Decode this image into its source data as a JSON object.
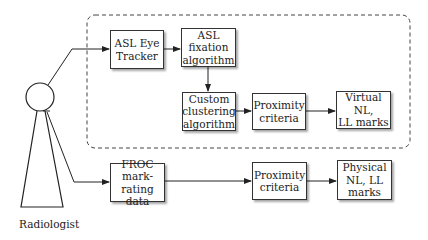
{
  "diagram": {
    "actor": {
      "label": "Radiologist"
    },
    "group": {
      "style": "dashed-rounded",
      "label": ""
    },
    "nodes": {
      "eye_tracker": "ASL Eye\nTracker",
      "fixation": "ASL\nfixation\nalgorithm",
      "clustering": "Custom\nclustering\nalgorithm",
      "proximity_top": "Proximity\ncriteria",
      "virtual_marks": "Virtual NL,\nLL marks",
      "froc": "FROC\nmark-rating\ndata",
      "proximity_bottom": "Proximity\ncriteria",
      "physical_marks": "Physical\nNL, LL\nmarks"
    },
    "edges": [
      [
        "Radiologist",
        "ASL Eye Tracker"
      ],
      [
        "ASL Eye Tracker",
        "ASL fixation algorithm"
      ],
      [
        "ASL fixation algorithm",
        "Custom clustering algorithm"
      ],
      [
        "Custom clustering algorithm",
        "Proximity criteria"
      ],
      [
        "Proximity criteria",
        "Virtual NL, LL marks"
      ],
      [
        "Radiologist",
        "FROC mark-rating data"
      ],
      [
        "FROC mark-rating data",
        "Proximity criteria"
      ],
      [
        "Proximity criteria",
        "Physical NL, LL marks"
      ]
    ]
  }
}
